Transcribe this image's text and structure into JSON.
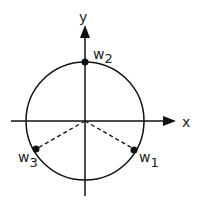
{
  "diagram": {
    "axes": {
      "x_label": "x",
      "y_label": "y"
    },
    "circle": {
      "type": "unit-circle"
    },
    "points": [
      {
        "name": "w1",
        "base": "w",
        "sub": "1",
        "angle_deg": -30
      },
      {
        "name": "w2",
        "base": "w",
        "sub": "2",
        "angle_deg": 90
      },
      {
        "name": "w3",
        "base": "w",
        "sub": "3",
        "angle_deg": 210
      }
    ],
    "dashed_radii_to": [
      "w1",
      "w3"
    ],
    "colors": {
      "stroke": "#111111",
      "text": "#222222",
      "background": "#ffffff"
    }
  }
}
